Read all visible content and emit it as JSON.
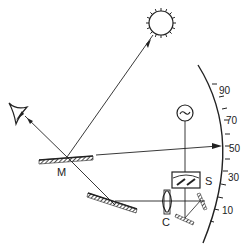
{
  "diagram": {
    "type": "optical-instrument-schematic",
    "labels": {
      "mirror_main": "M",
      "slit_box": "S",
      "condenser": "C"
    },
    "scale": {
      "ticks": [
        "90",
        "70",
        "50",
        "30",
        "10"
      ]
    },
    "icons": {
      "sun": "sun-icon",
      "eye": "eye-icon",
      "ac_source": "ac-source-icon"
    },
    "colors": {
      "line": "#222222",
      "background": "#ffffff"
    }
  }
}
